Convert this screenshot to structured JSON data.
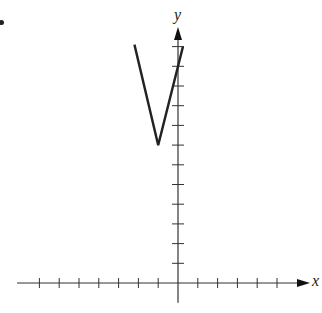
{
  "chart_data": {
    "type": "line",
    "title": "",
    "xlabel": "x",
    "ylabel": "y",
    "series": [
      {
        "name": "V-graph",
        "points": [
          [
            -2.2,
            12.1
          ],
          [
            -1,
            7
          ],
          [
            0.25,
            12.0
          ]
        ]
      }
    ],
    "vertex": [
      -1,
      7
    ],
    "x_ticks_left": 7,
    "x_ticks_right": 5,
    "y_ticks_up": 12,
    "y_ticks_down": 1,
    "grid": false,
    "xlim": [
      -8,
      6.5
    ],
    "ylim": [
      -1,
      13
    ],
    "colors": {
      "axis": "#333333",
      "line": "#222222"
    }
  },
  "labels": {
    "x": "x",
    "y": "y"
  }
}
